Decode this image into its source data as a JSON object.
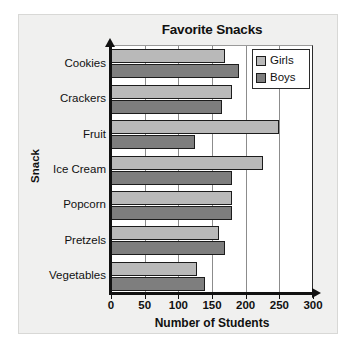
{
  "chart_data": {
    "type": "bar",
    "orientation": "horizontal",
    "title": "Favorite Snacks",
    "xlabel": "Number of Students",
    "ylabel": "Snack",
    "categories": [
      "Cookies",
      "Crackers",
      "Fruit",
      "Ice Cream",
      "Popcorn",
      "Pretzels",
      "Vegetables"
    ],
    "series": [
      {
        "name": "Girls",
        "color": "#b9b9b9",
        "values": [
          170,
          180,
          250,
          225,
          180,
          160,
          128
        ]
      },
      {
        "name": "Boys",
        "color": "#7e7e7e",
        "values": [
          190,
          165,
          125,
          180,
          180,
          170,
          140
        ]
      }
    ],
    "xlim": [
      0,
      300
    ],
    "xticks": [
      0,
      50,
      100,
      150,
      200,
      250,
      300
    ],
    "xtick_labels": [
      "0",
      "50",
      "100",
      "150",
      "200",
      "250",
      "300"
    ],
    "gridlines": [
      50,
      100,
      150,
      200,
      250
    ],
    "grid": true,
    "legend_position": "top-right"
  },
  "legend": {
    "entries": [
      {
        "label": "Girls",
        "swatch": "girls-swatch"
      },
      {
        "label": "Boys",
        "swatch": "boys-swatch"
      }
    ]
  }
}
